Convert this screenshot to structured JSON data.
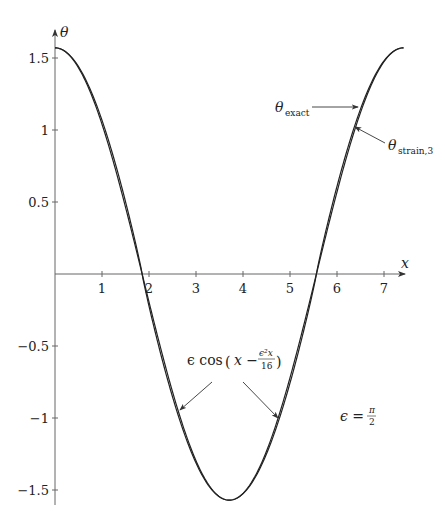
{
  "chart_data": {
    "type": "line",
    "title": "",
    "xlabel": "x",
    "ylabel": "θ",
    "xlim": [
      0,
      7.45
    ],
    "ylim": [
      -1.6,
      1.6
    ],
    "grid": false,
    "x_ticks": [
      "1",
      "2",
      "3",
      "4",
      "5",
      "6",
      "7"
    ],
    "y_ticks": [
      "1.5",
      "1",
      "0.5",
      "-0.5",
      "-1",
      "-1.5"
    ],
    "parameter": "ϵ = π/2",
    "series": [
      {
        "name": "θ_exact",
        "description": "Exact pendulum solution, amplitude π/2, period ≈ 7.416",
        "x": [
          0,
          0.5,
          1,
          1.5,
          1.854,
          2.5,
          3,
          3.708,
          4.5,
          5,
          5.562,
          6,
          6.5,
          7,
          7.416
        ],
        "values": [
          1.571,
          1.497,
          1.283,
          0.922,
          0.0,
          -0.778,
          -1.186,
          -1.571,
          -1.322,
          -0.883,
          0.0,
          0.732,
          1.227,
          1.503,
          1.571
        ]
      },
      {
        "name": "θ_strain,3",
        "description": "Strained-coordinate approximation ϵ cos(x − ϵ²x/16)",
        "x": [
          0,
          0.5,
          1,
          1.5,
          1.854,
          2.5,
          3,
          3.708,
          4.5,
          5,
          5.562,
          6,
          6.5,
          7,
          7.416
        ],
        "values": [
          1.571,
          1.421,
          1.001,
          0.389,
          -0.02,
          -1.03,
          -1.43,
          -1.571,
          -1.25,
          -0.84,
          0.02,
          0.68,
          1.2,
          1.51,
          1.571
        ]
      }
    ],
    "annotations": [
      {
        "text": "θ_exact",
        "target": "upper right curve, x≈6.5"
      },
      {
        "text": "θ_strain,3",
        "target": "upper right curve, x≈6.4"
      },
      {
        "text": "ϵ cos(x − ϵ²x/16)",
        "target": "both descending and ascending branches near θ≈-1"
      },
      {
        "text": "ϵ = π/2",
        "position": "lower right"
      }
    ]
  },
  "labels": {
    "x_axis": "x",
    "y_axis": "θ",
    "theta_exact_main": "θ",
    "theta_exact_sub": "exact",
    "theta_strain_main": "θ",
    "theta_strain_sub": "strain,3",
    "approx_prefix": "ϵ cos",
    "approx_inner": "x −",
    "approx_num": "ϵ²x",
    "approx_den": "16",
    "eps_label": "ϵ =",
    "eps_num": "π",
    "eps_den": "2"
  }
}
